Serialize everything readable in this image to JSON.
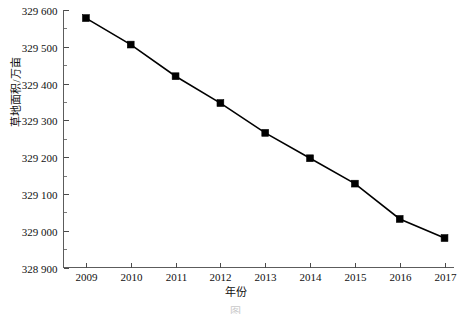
{
  "chart_data": {
    "type": "line",
    "title": "",
    "xlabel": "年份",
    "ylabel": "草地面积/万亩",
    "x": [
      2009,
      2010,
      2011,
      2012,
      2013,
      2014,
      2015,
      2016,
      2017
    ],
    "categories": [
      "2009",
      "2010",
      "2011",
      "2012",
      "2013",
      "2014",
      "2015",
      "2016",
      "2017"
    ],
    "series": [
      {
        "name": "草地面积",
        "values": [
          329578,
          329506,
          329420,
          329347,
          329266,
          329197,
          329128,
          329032,
          328980
        ],
        "marker": "filled-square",
        "color": "#000000"
      }
    ],
    "xlim": [
      2008.5,
      2017.2
    ],
    "ylim": [
      328900,
      329600
    ],
    "ytick_values": [
      328900,
      329000,
      329100,
      329200,
      329300,
      329400,
      329500,
      329600
    ],
    "ytick_labels": [
      "328 900",
      "329 000",
      "329 100",
      "329 200",
      "329 300",
      "329 400",
      "329 500",
      "329 600"
    ],
    "yminor_step": 50,
    "xtick_labels": [
      "2009",
      "2010",
      "2011",
      "2012",
      "2013",
      "2014",
      "2015",
      "2016",
      "2017"
    ],
    "grid": false,
    "legend": "none",
    "axis_color": "#5c5c5c"
  },
  "axes": {
    "y_title": "草地面积/万亩",
    "x_title": "年份"
  },
  "caption": {
    "text": "图"
  }
}
